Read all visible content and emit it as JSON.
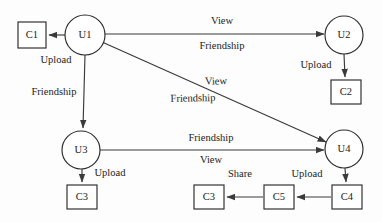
{
  "diagram": {
    "type": "social-network-graph",
    "colors": {
      "stroke": "#2b2b2b",
      "edge": "#3a3a3a",
      "text": "#1b1b1b",
      "background": "#ffffff"
    },
    "user_nodes": [
      {
        "id": "u1",
        "label": "U1",
        "cx": 85,
        "cy": 35,
        "r": 20
      },
      {
        "id": "u2",
        "label": "U2",
        "cx": 344,
        "cy": 35,
        "r": 19
      },
      {
        "id": "u3",
        "label": "U3",
        "cx": 81,
        "cy": 150,
        "r": 19
      },
      {
        "id": "u4",
        "label": "U4",
        "cx": 344,
        "cy": 149,
        "r": 19
      }
    ],
    "content_nodes": [
      {
        "id": "c1",
        "label": "C1",
        "x": 18,
        "y": 22,
        "w": 28,
        "h": 26
      },
      {
        "id": "c2",
        "label": "C2",
        "x": 331,
        "y": 80,
        "w": 30,
        "h": 24
      },
      {
        "id": "c3a",
        "label": "C3",
        "x": 67,
        "y": 185,
        "w": 30,
        "h": 24
      },
      {
        "id": "c3b",
        "label": "C3",
        "x": 194,
        "y": 185,
        "w": 30,
        "h": 24
      },
      {
        "id": "c5",
        "label": "C5",
        "x": 264,
        "y": 185,
        "w": 30,
        "h": 24
      },
      {
        "id": "c4",
        "label": "C4",
        "x": 332,
        "y": 185,
        "w": 30,
        "h": 24
      }
    ],
    "edges": [
      {
        "id": "e-u1-c1",
        "from": "u1",
        "to": "c1",
        "labels": [
          "Upload"
        ]
      },
      {
        "id": "e-u1-u2",
        "from": "u1",
        "to": "u2",
        "labels": [
          "View",
          "Friendship"
        ]
      },
      {
        "id": "e-u1-u3",
        "from": "u1",
        "to": "u3",
        "labels": [
          "Friendship"
        ]
      },
      {
        "id": "e-u1-u4",
        "from": "u1",
        "to": "u4",
        "labels": [
          "View",
          "Friendship"
        ]
      },
      {
        "id": "e-u2-c2",
        "from": "u2",
        "to": "c2",
        "labels": [
          "Upload"
        ]
      },
      {
        "id": "e-u3-u4",
        "from": "u3",
        "to": "u4",
        "labels": [
          "Friendship",
          "View"
        ]
      },
      {
        "id": "e-u3-c3a",
        "from": "u3",
        "to": "c3a",
        "labels": [
          "Upload"
        ]
      },
      {
        "id": "e-u4-c4",
        "from": "u4",
        "to": "c4",
        "labels": [
          "Upload"
        ]
      },
      {
        "id": "e-c4-c5",
        "from": "c4",
        "to": "c5",
        "labels": [
          "Upload"
        ]
      },
      {
        "id": "e-c5-c3b",
        "from": "c5",
        "to": "c3b",
        "labels": [
          "Share"
        ]
      }
    ],
    "edge_labels": {
      "u1_c1_upload": {
        "text": "Upload",
        "x": 56,
        "y": 61
      },
      "u1_u2_view": {
        "text": "View",
        "x": 222,
        "y": 22
      },
      "u1_u2_friendship": {
        "text": "Friendship",
        "x": 222,
        "y": 47
      },
      "u1_u3_friendship": {
        "text": "Friendship",
        "x": 54,
        "y": 93
      },
      "u1_u4_view": {
        "text": "View",
        "x": 216,
        "y": 82
      },
      "u1_u4_friendship": {
        "text": "Friendship",
        "x": 193,
        "y": 99
      },
      "u2_c2_upload": {
        "text": "Upload",
        "x": 317,
        "y": 66
      },
      "u3_u4_friendship": {
        "text": "Friendship",
        "x": 211,
        "y": 139
      },
      "u3_u4_view": {
        "text": "View",
        "x": 211,
        "y": 161
      },
      "u3_c3_upload": {
        "text": "Upload",
        "x": 110,
        "y": 174
      },
      "u4_c4_upload": {
        "text": "Upload",
        "x": 307,
        "y": 175
      },
      "c5_c3_share": {
        "text": "Share",
        "x": 240,
        "y": 175
      }
    }
  }
}
